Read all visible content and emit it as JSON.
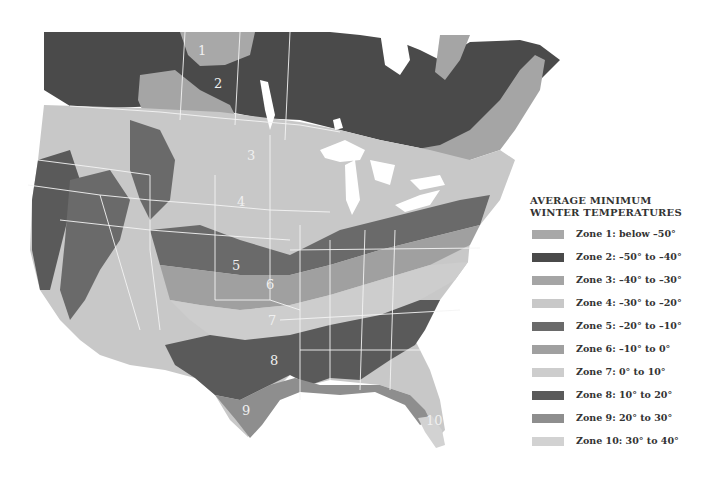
{
  "legend": {
    "title_line1": "AVERAGE MINIMUM",
    "title_line2": "WINTER TEMPERATURES",
    "items": [
      {
        "label": "Zone 1: below –50°",
        "color": "#a8a8a8"
      },
      {
        "label": "Zone 2: –50° to –40°",
        "color": "#4a4a4a"
      },
      {
        "label": "Zone 3: –40° to –30°",
        "color": "#a5a5a5"
      },
      {
        "label": "Zone 4: –30° to –20°",
        "color": "#c8c8c8"
      },
      {
        "label": "Zone 5: –20° to –10°",
        "color": "#6a6a6a"
      },
      {
        "label": "Zone 6: –10° to 0°",
        "color": "#a0a0a0"
      },
      {
        "label": "Zone 7: 0° to 10°",
        "color": "#cdcdcd"
      },
      {
        "label": "Zone 8: 10° to 20°",
        "color": "#5a5a5a"
      },
      {
        "label": "Zone 9: 20° to 30°",
        "color": "#8e8e8e"
      },
      {
        "label": "Zone 10: 30° to 40°",
        "color": "#d2d2d2"
      }
    ]
  },
  "map": {
    "zone_labels": [
      {
        "text": "1",
        "x": 203,
        "y": 55
      },
      {
        "text": "2",
        "x": 219,
        "y": 87
      },
      {
        "text": "3",
        "x": 252,
        "y": 160
      },
      {
        "text": "4",
        "x": 242,
        "y": 205
      },
      {
        "text": "5",
        "x": 237,
        "y": 269
      },
      {
        "text": "6",
        "x": 270,
        "y": 288
      },
      {
        "text": "7",
        "x": 272,
        "y": 324
      },
      {
        "text": "8",
        "x": 274,
        "y": 364
      },
      {
        "text": "9",
        "x": 246,
        "y": 414
      },
      {
        "text": "10",
        "x": 435,
        "y": 424
      }
    ]
  }
}
